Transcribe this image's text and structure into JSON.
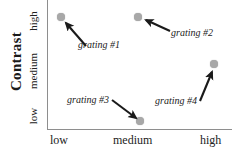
{
  "chart_data": {
    "type": "scatter",
    "title": "",
    "xlabel": "",
    "ylabel": "Contrast",
    "x_tick_labels": [
      "low",
      "medium",
      "high"
    ],
    "y_tick_labels": [
      "low",
      "medium",
      "high"
    ],
    "grid": false,
    "legend": "none",
    "point_color": "#a8a8a8",
    "axis_color": "#8e8e8e",
    "points": [
      {
        "label": "grating #1",
        "x": "low",
        "y": "high",
        "px": 61,
        "py": 17
      },
      {
        "label": "grating #2",
        "x": "medium",
        "y": "high",
        "px": 138,
        "py": 17
      },
      {
        "label": "grating #3",
        "x": "medium",
        "y": "low",
        "px": 140,
        "py": 121
      },
      {
        "label": "grating #4",
        "x": "high",
        "y": "medium",
        "px": 214,
        "py": 64
      }
    ],
    "annotations": [
      {
        "text": "grating #1",
        "label_x": 78,
        "label_y": 39,
        "arrow_from": [
          86,
          46
        ],
        "arrow_to": [
          66,
          23
        ]
      },
      {
        "text": "grating #2",
        "label_x": 171,
        "label_y": 27,
        "arrow_from": [
          170,
          31
        ],
        "arrow_to": [
          146,
          20
        ]
      },
      {
        "text": "grating #3",
        "label_x": 67,
        "label_y": 94,
        "arrow_from": [
          112,
          100
        ],
        "arrow_to": [
          136,
          118
        ]
      },
      {
        "text": "grating #4",
        "label_x": 155,
        "label_y": 95,
        "arrow_from": [
          200,
          101
        ],
        "arrow_to": [
          212,
          72
        ]
      }
    ]
  },
  "axes": {
    "y_title": "Contrast",
    "y_ticks": {
      "high": "high",
      "medium": "medium",
      "low": "low"
    },
    "x_ticks": {
      "low": "low",
      "medium": "medium",
      "high": "high"
    }
  },
  "annotations": {
    "grating1": "grating #1",
    "grating2": "grating #2",
    "grating3": "grating #3",
    "grating4": "grating #4"
  }
}
